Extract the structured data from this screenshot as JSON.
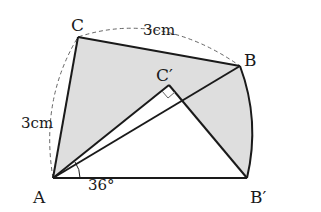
{
  "diagram": {
    "points": {
      "A": {
        "label": "A",
        "x": 53,
        "y": 178
      },
      "B": {
        "label": "B",
        "x": 240,
        "y": 66
      },
      "C": {
        "label": "C",
        "x": 78,
        "y": 37
      },
      "C_prime": {
        "label": "C′",
        "x": 169,
        "y": 85
      },
      "B_prime": {
        "label": "B′",
        "x": 247,
        "y": 178
      }
    },
    "labels": {
      "top_side": "3cm",
      "left_side": "3cm",
      "angle": "36°"
    },
    "colors": {
      "shade": "#dedede",
      "stroke": "#1a1a1a",
      "dashed": "#666666"
    }
  }
}
